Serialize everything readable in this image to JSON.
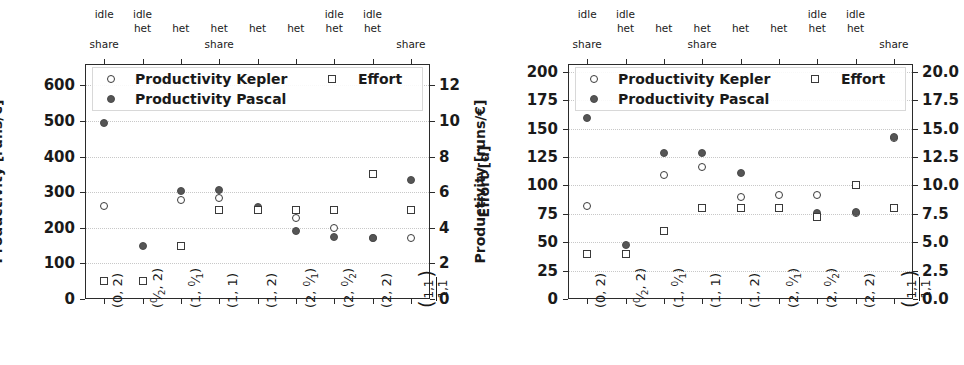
{
  "chart_data": [
    {
      "panel": "left",
      "type": "scatter",
      "title": "",
      "ylabel": "Productivity [runs/€]",
      "y2label": "Effort [d]",
      "xlabel": "",
      "ylim": [
        0,
        660
      ],
      "y2lim": [
        0,
        13.2
      ],
      "yticks": [
        0,
        100,
        200,
        300,
        400,
        500,
        600
      ],
      "ytick_labels": [
        "0",
        "100",
        "200",
        "300",
        "400",
        "500",
        "600"
      ],
      "y2ticks": [
        0,
        2,
        4,
        6,
        8,
        10,
        12
      ],
      "y2tick_labels": [
        "0",
        "2",
        "4",
        "6",
        "8",
        "10",
        "12"
      ],
      "grid": true,
      "legend_position": "upper-center",
      "categories": [
        "(0, 2)",
        "(0/2, 2)",
        "(1, 0/1)",
        "(1, 1)",
        "(1, 2)",
        "(2, 0/1)",
        "(2, 0/2)",
        "(2, 2)",
        "(1,1 / 1,1)"
      ],
      "top_annotations": [
        {
          "idle": "idle",
          "het": "",
          "share": "share"
        },
        {
          "idle": "idle",
          "het": "het",
          "share": ""
        },
        {
          "idle": "",
          "het": "het",
          "share": ""
        },
        {
          "idle": "",
          "het": "het",
          "share": "share"
        },
        {
          "idle": "",
          "het": "het",
          "share": ""
        },
        {
          "idle": "",
          "het": "het",
          "share": ""
        },
        {
          "idle": "idle",
          "het": "het",
          "share": ""
        },
        {
          "idle": "idle",
          "het": "het",
          "share": ""
        },
        {
          "idle": "",
          "het": "",
          "share": "share"
        }
      ],
      "series": [
        {
          "name": "Productivity Kepler",
          "marker": "circle-open",
          "axis": "left",
          "values": [
            262,
            null,
            278,
            285,
            252,
            228,
            200,
            172,
            172
          ]
        },
        {
          "name": "Productivity Pascal",
          "marker": "circle-filled",
          "axis": "left",
          "values": [
            494,
            148,
            303,
            305,
            258,
            190,
            175,
            172,
            335
          ]
        },
        {
          "name": "Effort",
          "marker": "square-open",
          "axis": "right",
          "values": [
            1.0,
            1.0,
            3.0,
            5.0,
            5.0,
            5.0,
            5.0,
            7.0,
            5.0
          ]
        }
      ]
    },
    {
      "panel": "right",
      "type": "scatter",
      "title": "",
      "ylabel": "Productivity [runs/€]",
      "y2label": "Effort [d]",
      "xlabel": "",
      "ylim": [
        0,
        207
      ],
      "y2lim": [
        0,
        20.7
      ],
      "yticks": [
        0,
        25,
        50,
        75,
        100,
        125,
        150,
        175,
        200
      ],
      "ytick_labels": [
        "0",
        "25",
        "50",
        "75",
        "100",
        "125",
        "150",
        "175",
        "200"
      ],
      "y2ticks": [
        0,
        2.5,
        5.0,
        7.5,
        10.0,
        12.5,
        15.0,
        17.5,
        20.0
      ],
      "y2tick_labels": [
        "0.0",
        "2.5",
        "5.0",
        "7.5",
        "10.0",
        "12.5",
        "15.0",
        "17.5",
        "20.0"
      ],
      "grid": true,
      "legend_position": "upper-center",
      "categories": [
        "(0, 2)",
        "(0/2, 2)",
        "(1, 0/1)",
        "(1, 1)",
        "(1, 2)",
        "(2, 0/1)",
        "(2, 0/2)",
        "(2, 2)",
        "(1,1 / 1,1)"
      ],
      "top_annotations": [
        {
          "idle": "idle",
          "het": "",
          "share": "share"
        },
        {
          "idle": "idle",
          "het": "het",
          "share": ""
        },
        {
          "idle": "",
          "het": "het",
          "share": ""
        },
        {
          "idle": "",
          "het": "het",
          "share": "share"
        },
        {
          "idle": "",
          "het": "het",
          "share": ""
        },
        {
          "idle": "",
          "het": "het",
          "share": ""
        },
        {
          "idle": "idle",
          "het": "het",
          "share": ""
        },
        {
          "idle": "idle",
          "het": "het",
          "share": ""
        },
        {
          "idle": "",
          "het": "",
          "share": "share"
        }
      ],
      "series": [
        {
          "name": "Productivity Kepler",
          "marker": "circle-open",
          "axis": "left",
          "values": [
            82,
            null,
            109,
            116,
            90,
            92,
            92,
            76,
            142
          ]
        },
        {
          "name": "Productivity Pascal",
          "marker": "circle-filled",
          "axis": "left",
          "values": [
            159,
            48,
            129,
            129,
            111,
            80,
            76,
            77,
            143
          ]
        },
        {
          "name": "Effort",
          "marker": "square-open",
          "axis": "right",
          "values": [
            4.0,
            4.0,
            6.0,
            8.0,
            8.0,
            8.0,
            7.2,
            10.0,
            8.0
          ]
        }
      ]
    }
  ],
  "legend": {
    "kepler": "Productivity Kepler",
    "pascal": "Productivity Pascal",
    "effort": "Effort"
  },
  "labels": {
    "y_productivity": "Productivity [runs/€]",
    "y_effort": "Effort [d]",
    "idle": "idle",
    "het": "het",
    "share": "share"
  },
  "colors": {
    "marker_open": "#3a3a3a",
    "marker_fill": "#555555",
    "axis": "#2b2b2b",
    "grid": "#c8c8c8",
    "background": "#ffffff"
  }
}
